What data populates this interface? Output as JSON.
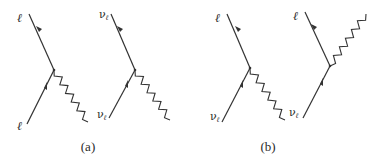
{
  "figure": {
    "panels": [
      {
        "caption": "(a)",
        "diagrams": [
          {
            "outgoing_label": "ℓ",
            "incoming_label": "ℓ",
            "boson": "down"
          },
          {
            "outgoing_label": "ν",
            "outgoing_sub": "ℓ",
            "incoming_label": "ν",
            "incoming_sub": "ℓ",
            "boson": "down"
          }
        ]
      },
      {
        "caption": "(b)",
        "diagrams": [
          {
            "outgoing_label": "ℓ",
            "incoming_label": "ν",
            "incoming_sub": "ℓ",
            "boson": "down"
          },
          {
            "outgoing_label": "ℓ",
            "incoming_label": "ν",
            "incoming_sub": "ℓ",
            "boson": "up"
          }
        ]
      }
    ]
  }
}
